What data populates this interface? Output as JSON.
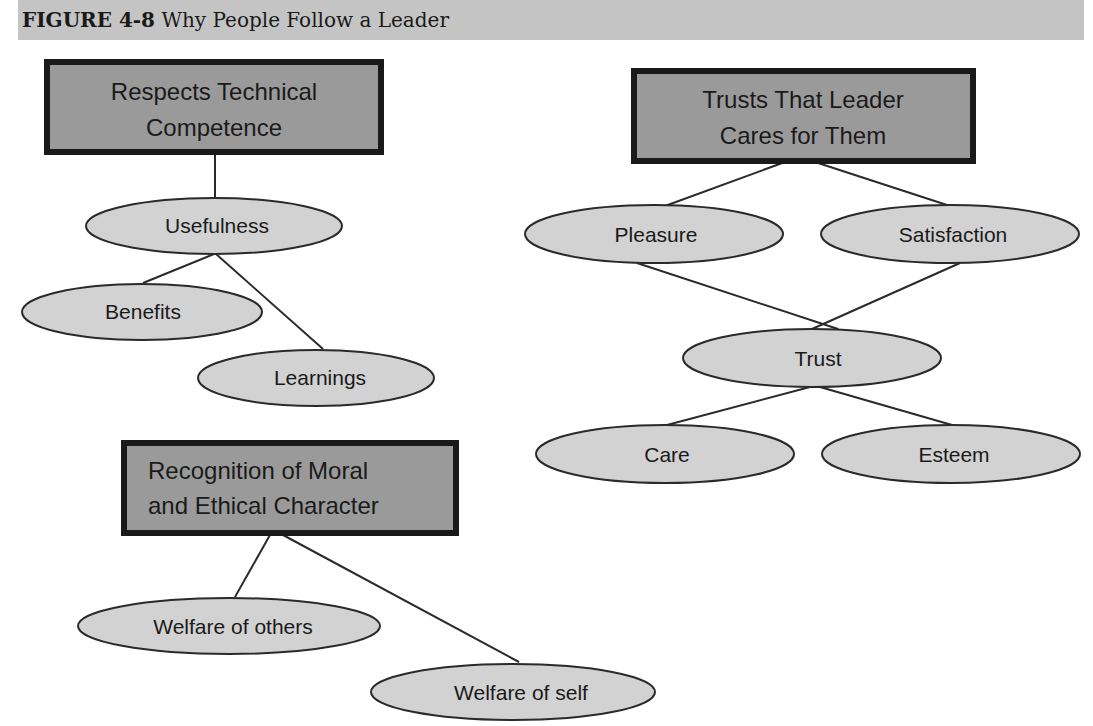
{
  "header": {
    "figure_label": "FIGURE 4-8",
    "title": "Why People Follow a Leader"
  },
  "colors": {
    "header_bg": "#c4c4c4",
    "box_fill": "#9a9a9a",
    "box_border": "#1a1a1a",
    "ellipse_fill": "#d2d2d2",
    "line": "#2a2a2a"
  },
  "groups": [
    {
      "box": {
        "line1": "Respects Technical",
        "line2": "Competence"
      },
      "nodes": [
        "Usefulness",
        "Benefits",
        "Learnings"
      ]
    },
    {
      "box": {
        "line1": "Trusts That Leader",
        "line2": "Cares for Them"
      },
      "nodes": [
        "Pleasure",
        "Satisfaction",
        "Trust",
        "Care",
        "Esteem"
      ]
    },
    {
      "box": {
        "line1": "Recognition of Moral",
        "line2": "and Ethical Character"
      },
      "nodes": [
        "Welfare of others",
        "Welfare of self"
      ]
    }
  ]
}
